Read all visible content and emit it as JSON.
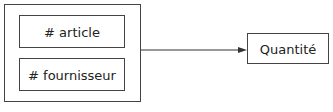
{
  "diagram": {
    "group": {
      "items": [
        {
          "label": "# article"
        },
        {
          "label": "# fournisseur"
        }
      ]
    },
    "target": {
      "label": "Quantité"
    },
    "edges": [
      {
        "from": "group",
        "to": "target",
        "type": "arrow"
      }
    ]
  }
}
